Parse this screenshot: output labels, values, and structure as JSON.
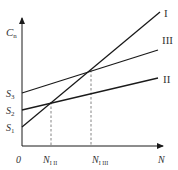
{
  "axes": {
    "y_label": "C",
    "y_label_sub": "n",
    "x_label": "N",
    "origin": "0"
  },
  "y_ticks": [
    {
      "main": "S",
      "sub": "3"
    },
    {
      "main": "S",
      "sub": "2"
    },
    {
      "main": "S",
      "sub": "1"
    }
  ],
  "x_ticks": [
    {
      "main": "N",
      "sub": "I II"
    },
    {
      "main": "N",
      "sub": "I III"
    }
  ],
  "lines": [
    {
      "label": "I"
    },
    {
      "label": "III"
    },
    {
      "label": "II"
    }
  ],
  "colors": {
    "line": "#1a1a1a",
    "text": "#333333",
    "dash": "#666666"
  }
}
